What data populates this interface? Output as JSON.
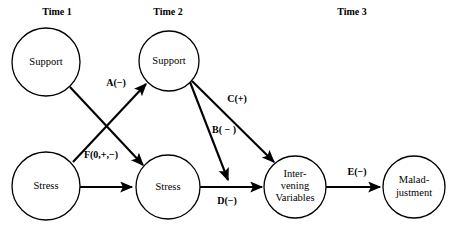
{
  "diagram": {
    "background_color": "#ffffff",
    "line_color": "#000000",
    "time_headers": [
      {
        "id": "time-1",
        "label": "Time 1",
        "x": 57,
        "y": 13
      },
      {
        "id": "time-2",
        "label": "Time 2",
        "x": 168,
        "y": 13
      },
      {
        "id": "time-3",
        "label": "Time 3",
        "x": 352,
        "y": 13
      }
    ],
    "nodes": [
      {
        "id": "support-t1",
        "lines": [
          "Support"
        ],
        "cx": 46,
        "cy": 62,
        "r": 34
      },
      {
        "id": "support-t2",
        "lines": [
          "Support"
        ],
        "cx": 169,
        "cy": 61,
        "r": 30
      },
      {
        "id": "stress-t1",
        "lines": [
          "Stress"
        ],
        "cx": 46,
        "cy": 186,
        "r": 34
      },
      {
        "id": "stress-t2",
        "lines": [
          "Stress"
        ],
        "cx": 168,
        "cy": 187,
        "r": 32
      },
      {
        "id": "intervening-variables",
        "lines": [
          "Inter-",
          "vening",
          "Variables"
        ],
        "cx": 295,
        "cy": 187,
        "r": 31
      },
      {
        "id": "maladjustment",
        "lines": [
          "Malad-",
          "justment"
        ],
        "cx": 414,
        "cy": 187,
        "r": 31
      }
    ],
    "edges": [
      {
        "id": "edge-stress-t1-to-support-t2",
        "label": "A(−)",
        "label_x": 116,
        "label_y": 84,
        "from": "stress-t1",
        "to": "support-t2",
        "x1": 73,
        "y1": 162,
        "x2": 146,
        "y2": 84
      },
      {
        "id": "edge-support-t1-to-stress-t2",
        "label": "F(0,+,−)",
        "label_x": 101,
        "label_y": 156,
        "from": "support-t1",
        "to": "stress-t2",
        "x1": 70,
        "y1": 87,
        "x2": 143,
        "y2": 165
      },
      {
        "id": "edge-support-t2-to-intervening",
        "label": "C(+)",
        "label_x": 237,
        "label_y": 100,
        "from": "support-t2",
        "to": "intervening-variables",
        "x1": 192,
        "y1": 81,
        "x2": 276,
        "y2": 163
      },
      {
        "id": "edge-support-t2-to-stress-path",
        "label": "B( − )",
        "label_x": 224,
        "label_y": 131,
        "from": "support-t2",
        "to": "stress-t2-to-intervening-line",
        "x1": 190,
        "y1": 82,
        "x2": 228,
        "y2": 182
      },
      {
        "id": "edge-stress-t2-to-intervening",
        "label": "D(−)",
        "label_x": 227,
        "label_y": 202,
        "from": "stress-t2",
        "to": "intervening-variables",
        "x1": 200,
        "y1": 187,
        "x2": 263,
        "y2": 187
      },
      {
        "id": "edge-intervening-to-maladjustment",
        "label": "E(−)",
        "label_x": 357,
        "label_y": 173,
        "from": "intervening-variables",
        "to": "maladjustment",
        "x1": 326,
        "y1": 187,
        "x2": 381,
        "y2": 187
      },
      {
        "id": "edge-stress-t1-to-stress-t2",
        "label": "",
        "from": "stress-t1",
        "to": "stress-t2",
        "x1": 80,
        "y1": 187,
        "x2": 134,
        "y2": 187
      }
    ]
  }
}
